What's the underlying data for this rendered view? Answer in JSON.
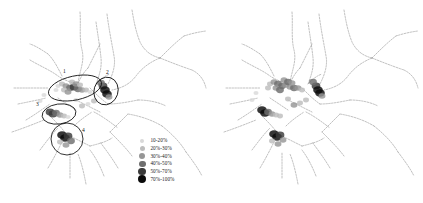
{
  "figure": {
    "background": "#ffffff",
    "panel_count": 2,
    "width": 423,
    "height": 203
  },
  "legend": {
    "title": "",
    "items": [
      {
        "label": "10-20%",
        "color": "#d9d9d9",
        "size": 2.2
      },
      {
        "label": "20%-30%",
        "color": "#bdbdbd",
        "size": 2.6
      },
      {
        "label": "30%-40%",
        "color": "#969696",
        "size": 3.0
      },
      {
        "label": "40%-50%",
        "color": "#6e6e6e",
        "size": 3.4
      },
      {
        "label": "50%-70%",
        "color": "#3a3a3a",
        "size": 3.8
      },
      {
        "label": "70%-100%",
        "color": "#0a0a0a",
        "size": 4.2
      }
    ]
  },
  "panels": {
    "left": {
      "name": "map-left",
      "annotations": [
        {
          "id": "1",
          "label": "1",
          "shape": "ellipse",
          "cx": 75,
          "cy": 88,
          "rx": 27,
          "ry": 12,
          "rot": -12,
          "label_x": 63,
          "label_y": 73
        },
        {
          "id": "2",
          "label": "2",
          "shape": "ellipse",
          "cx": 106,
          "cy": 91,
          "rx": 12,
          "ry": 14,
          "rot": 18,
          "label_x": 106,
          "label_y": 74
        },
        {
          "id": "3",
          "label": "3",
          "shape": "ellipse",
          "cx": 59,
          "cy": 114,
          "rx": 17,
          "ry": 10,
          "rot": -8,
          "label_x": 36,
          "label_y": 106
        },
        {
          "id": "4",
          "label": "4",
          "shape": "ellipse",
          "cx": 67,
          "cy": 139,
          "rx": 16,
          "ry": 16,
          "rot": 0,
          "label_x": 82,
          "label_y": 132
        }
      ]
    },
    "right": {
      "name": "map-right",
      "annotations": []
    }
  },
  "chart_data": {
    "type": "scatter",
    "title": "",
    "xlabel": "",
    "ylabel": "",
    "classes": [
      "10-20%",
      "20%-30%",
      "30%-40%",
      "40%-50%",
      "50%-70%",
      "70%-100%"
    ],
    "class_colors": [
      "#d9d9d9",
      "#bdbdbd",
      "#969696",
      "#6e6e6e",
      "#3a3a3a",
      "#0a0a0a"
    ],
    "legend_position": "bottom-right",
    "grid": false,
    "series": [
      {
        "name": "left-panel-points",
        "points": [
          {
            "x": 58,
            "y": 86,
            "cls": 1
          },
          {
            "x": 62,
            "y": 84,
            "cls": 2
          },
          {
            "x": 66,
            "y": 86,
            "cls": 3
          },
          {
            "x": 70,
            "y": 88,
            "cls": 4
          },
          {
            "x": 74,
            "y": 87,
            "cls": 5
          },
          {
            "x": 78,
            "y": 89,
            "cls": 4
          },
          {
            "x": 82,
            "y": 90,
            "cls": 3
          },
          {
            "x": 86,
            "y": 90,
            "cls": 2
          },
          {
            "x": 90,
            "y": 92,
            "cls": 1
          },
          {
            "x": 72,
            "y": 82,
            "cls": 2
          },
          {
            "x": 76,
            "y": 84,
            "cls": 3
          },
          {
            "x": 80,
            "y": 85,
            "cls": 2
          },
          {
            "x": 64,
            "y": 90,
            "cls": 2
          },
          {
            "x": 68,
            "y": 92,
            "cls": 3
          },
          {
            "x": 56,
            "y": 90,
            "cls": 1
          },
          {
            "x": 103,
            "y": 86,
            "cls": 5
          },
          {
            "x": 105,
            "y": 90,
            "cls": 6
          },
          {
            "x": 107,
            "y": 94,
            "cls": 6
          },
          {
            "x": 101,
            "y": 83,
            "cls": 4
          },
          {
            "x": 109,
            "y": 97,
            "cls": 3
          },
          {
            "x": 50,
            "y": 112,
            "cls": 5
          },
          {
            "x": 53,
            "y": 114,
            "cls": 5
          },
          {
            "x": 56,
            "y": 113,
            "cls": 4
          },
          {
            "x": 60,
            "y": 115,
            "cls": 3
          },
          {
            "x": 64,
            "y": 116,
            "cls": 2
          },
          {
            "x": 68,
            "y": 117,
            "cls": 1
          },
          {
            "x": 62,
            "y": 135,
            "cls": 6
          },
          {
            "x": 65,
            "y": 138,
            "cls": 6
          },
          {
            "x": 68,
            "y": 136,
            "cls": 5
          },
          {
            "x": 71,
            "y": 141,
            "cls": 4
          },
          {
            "x": 66,
            "y": 145,
            "cls": 3
          },
          {
            "x": 60,
            "y": 142,
            "cls": 2
          },
          {
            "x": 94,
            "y": 101,
            "cls": 2
          },
          {
            "x": 88,
            "y": 104,
            "cls": 1
          },
          {
            "x": 82,
            "y": 106,
            "cls": 2
          },
          {
            "x": 76,
            "y": 100,
            "cls": 1
          },
          {
            "x": 44,
            "y": 95,
            "cls": 1
          },
          {
            "x": 40,
            "y": 101,
            "cls": 1
          }
        ]
      },
      {
        "name": "right-panel-points",
        "points": [
          {
            "x": 58,
            "y": 84,
            "cls": 2
          },
          {
            "x": 62,
            "y": 82,
            "cls": 3
          },
          {
            "x": 66,
            "y": 84,
            "cls": 4
          },
          {
            "x": 70,
            "y": 86,
            "cls": 4
          },
          {
            "x": 74,
            "y": 85,
            "cls": 3
          },
          {
            "x": 78,
            "y": 87,
            "cls": 3
          },
          {
            "x": 82,
            "y": 88,
            "cls": 4
          },
          {
            "x": 86,
            "y": 88,
            "cls": 3
          },
          {
            "x": 90,
            "y": 90,
            "cls": 2
          },
          {
            "x": 72,
            "y": 80,
            "cls": 3
          },
          {
            "x": 76,
            "y": 82,
            "cls": 4
          },
          {
            "x": 80,
            "y": 83,
            "cls": 3
          },
          {
            "x": 64,
            "y": 88,
            "cls": 3
          },
          {
            "x": 68,
            "y": 90,
            "cls": 4
          },
          {
            "x": 56,
            "y": 88,
            "cls": 2
          },
          {
            "x": 104,
            "y": 86,
            "cls": 5
          },
          {
            "x": 106,
            "y": 90,
            "cls": 6
          },
          {
            "x": 108,
            "y": 93,
            "cls": 6
          },
          {
            "x": 101,
            "y": 82,
            "cls": 4
          },
          {
            "x": 110,
            "y": 96,
            "cls": 3
          },
          {
            "x": 50,
            "y": 110,
            "cls": 6
          },
          {
            "x": 53,
            "y": 113,
            "cls": 6
          },
          {
            "x": 56,
            "y": 112,
            "cls": 4
          },
          {
            "x": 60,
            "y": 114,
            "cls": 3
          },
          {
            "x": 64,
            "y": 115,
            "cls": 2
          },
          {
            "x": 68,
            "y": 116,
            "cls": 2
          },
          {
            "x": 62,
            "y": 134,
            "cls": 6
          },
          {
            "x": 65,
            "y": 137,
            "cls": 6
          },
          {
            "x": 68,
            "y": 135,
            "cls": 5
          },
          {
            "x": 71,
            "y": 140,
            "cls": 3
          },
          {
            "x": 66,
            "y": 144,
            "cls": 3
          },
          {
            "x": 60,
            "y": 141,
            "cls": 2
          },
          {
            "x": 94,
            "y": 100,
            "cls": 2
          },
          {
            "x": 88,
            "y": 103,
            "cls": 2
          },
          {
            "x": 82,
            "y": 105,
            "cls": 3
          },
          {
            "x": 76,
            "y": 99,
            "cls": 2
          },
          {
            "x": 44,
            "y": 93,
            "cls": 1
          },
          {
            "x": 40,
            "y": 100,
            "cls": 1
          }
        ]
      }
    ]
  }
}
